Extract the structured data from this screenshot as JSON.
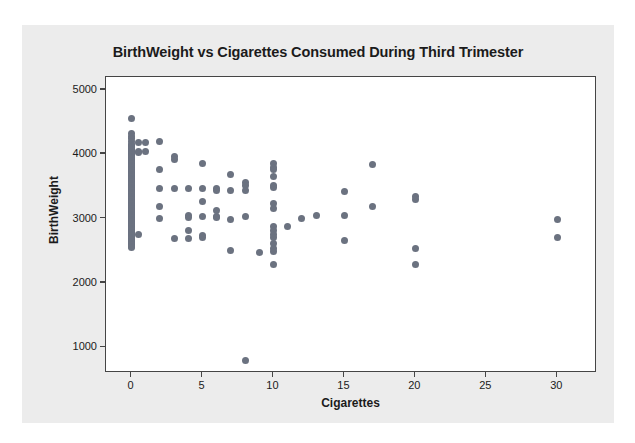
{
  "chart_data": {
    "type": "scatter",
    "title": "BirthWeight vs Cigarettes Consumed During Third Trimester",
    "xlabel": "Cigarettes",
    "ylabel": "BirthWeight",
    "xlim": [
      -1.8,
      32.8
    ],
    "ylim": [
      600,
      5200
    ],
    "xticks": [
      0,
      5,
      10,
      15,
      20,
      25,
      30
    ],
    "xtick_labels": [
      "0",
      "5",
      "10",
      "15",
      "20",
      "25",
      "30"
    ],
    "yticks": [
      1000,
      2000,
      3000,
      4000,
      5000
    ],
    "ytick_labels": [
      "1000",
      "2000",
      "3000",
      "4000",
      "5000"
    ],
    "grid": false,
    "legend": false,
    "marker_color": "#6b7280",
    "marker_size": 7,
    "plot_bg": "#ffffff",
    "panel_bg": "#ececec",
    "axis_color": "#454545",
    "points": [
      [
        0,
        4560
      ],
      [
        0,
        4320
      ],
      [
        0,
        4280
      ],
      [
        0,
        4240
      ],
      [
        0,
        4200
      ],
      [
        0,
        4150
      ],
      [
        0,
        4140
      ],
      [
        0,
        4120
      ],
      [
        0,
        4100
      ],
      [
        0,
        4090
      ],
      [
        0,
        4070
      ],
      [
        0,
        4050
      ],
      [
        0,
        4030
      ],
      [
        0,
        4010
      ],
      [
        0,
        3990
      ],
      [
        0,
        3970
      ],
      [
        0,
        3950
      ],
      [
        0,
        3930
      ],
      [
        0,
        3910
      ],
      [
        0,
        3890
      ],
      [
        0,
        3870
      ],
      [
        0,
        3850
      ],
      [
        0,
        3830
      ],
      [
        0,
        3810
      ],
      [
        0,
        3790
      ],
      [
        0,
        3770
      ],
      [
        0,
        3750
      ],
      [
        0,
        3730
      ],
      [
        0,
        3710
      ],
      [
        0,
        3690
      ],
      [
        0,
        3670
      ],
      [
        0,
        3650
      ],
      [
        0,
        3630
      ],
      [
        0,
        3610
      ],
      [
        0,
        3590
      ],
      [
        0,
        3570
      ],
      [
        0,
        3550
      ],
      [
        0,
        3530
      ],
      [
        0,
        3510
      ],
      [
        0,
        3490
      ],
      [
        0,
        3470
      ],
      [
        0,
        3450
      ],
      [
        0,
        3430
      ],
      [
        0,
        3410
      ],
      [
        0,
        3390
      ],
      [
        0,
        3370
      ],
      [
        0,
        3350
      ],
      [
        0,
        3330
      ],
      [
        0,
        3310
      ],
      [
        0,
        3290
      ],
      [
        0,
        3270
      ],
      [
        0,
        3250
      ],
      [
        0,
        3230
      ],
      [
        0,
        3210
      ],
      [
        0,
        3190
      ],
      [
        0,
        3170
      ],
      [
        0,
        3150
      ],
      [
        0,
        3130
      ],
      [
        0,
        3110
      ],
      [
        0,
        3090
      ],
      [
        0,
        3070
      ],
      [
        0,
        3050
      ],
      [
        0,
        3030
      ],
      [
        0,
        3010
      ],
      [
        0,
        2990
      ],
      [
        0,
        2970
      ],
      [
        0,
        2950
      ],
      [
        0,
        2930
      ],
      [
        0,
        2910
      ],
      [
        0,
        2890
      ],
      [
        0,
        2870
      ],
      [
        0,
        2850
      ],
      [
        0,
        2830
      ],
      [
        0,
        2810
      ],
      [
        0,
        2790
      ],
      [
        0,
        2770
      ],
      [
        0,
        2750
      ],
      [
        0,
        2730
      ],
      [
        0,
        2710
      ],
      [
        0,
        2690
      ],
      [
        0,
        2670
      ],
      [
        0,
        2650
      ],
      [
        0,
        2630
      ],
      [
        0,
        2610
      ],
      [
        0,
        2590
      ],
      [
        0,
        2570
      ],
      [
        0,
        2550
      ],
      [
        0.5,
        4180
      ],
      [
        0.5,
        4050
      ],
      [
        0.5,
        4030
      ],
      [
        0.5,
        2760
      ],
      [
        1,
        4180
      ],
      [
        1,
        4040
      ],
      [
        2,
        4190
      ],
      [
        2,
        3760
      ],
      [
        2,
        3460
      ],
      [
        2,
        3190
      ],
      [
        2,
        3000
      ],
      [
        3,
        3960
      ],
      [
        3,
        3920
      ],
      [
        3,
        3460
      ],
      [
        3,
        2690
      ],
      [
        4,
        3460
      ],
      [
        4,
        3040
      ],
      [
        4,
        3010
      ],
      [
        4,
        2820
      ],
      [
        4,
        2690
      ],
      [
        5,
        3850
      ],
      [
        5,
        3460
      ],
      [
        5,
        3260
      ],
      [
        5,
        3030
      ],
      [
        5,
        2730
      ],
      [
        5,
        2700
      ],
      [
        6,
        3460
      ],
      [
        6,
        3440
      ],
      [
        6,
        3120
      ],
      [
        6,
        3030
      ],
      [
        6,
        3010
      ],
      [
        7,
        3680
      ],
      [
        7,
        3430
      ],
      [
        7,
        2980
      ],
      [
        7,
        2510
      ],
      [
        8,
        3560
      ],
      [
        8,
        3520
      ],
      [
        8,
        3440
      ],
      [
        8,
        3030
      ],
      [
        8,
        800
      ],
      [
        9,
        2480
      ],
      [
        10,
        3850
      ],
      [
        10,
        3800
      ],
      [
        10,
        3760
      ],
      [
        10,
        3650
      ],
      [
        10,
        3520
      ],
      [
        10,
        3480
      ],
      [
        10,
        3240
      ],
      [
        10,
        3150
      ],
      [
        10,
        2880
      ],
      [
        10,
        2820
      ],
      [
        10,
        2760
      ],
      [
        10,
        2700
      ],
      [
        10,
        2620
      ],
      [
        10,
        2540
      ],
      [
        10,
        2490
      ],
      [
        10,
        2290
      ],
      [
        11,
        2870
      ],
      [
        12,
        3000
      ],
      [
        13,
        3040
      ],
      [
        15,
        3420
      ],
      [
        15,
        3040
      ],
      [
        15,
        2660
      ],
      [
        17,
        3840
      ],
      [
        17,
        3190
      ],
      [
        20,
        3350
      ],
      [
        20,
        3290
      ],
      [
        20,
        2540
      ],
      [
        20,
        2280
      ],
      [
        30,
        2980
      ],
      [
        30,
        2710
      ]
    ]
  }
}
